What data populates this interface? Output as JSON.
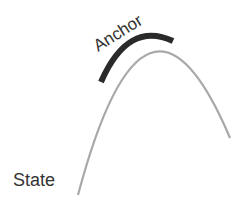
{
  "labels": {
    "anchor": "Anchor",
    "state": "State"
  },
  "colors": {
    "state_curve": "#a8a8a8",
    "anchor_arc": "#2a2a2a",
    "text": "#333333",
    "background": "#ffffff"
  }
}
